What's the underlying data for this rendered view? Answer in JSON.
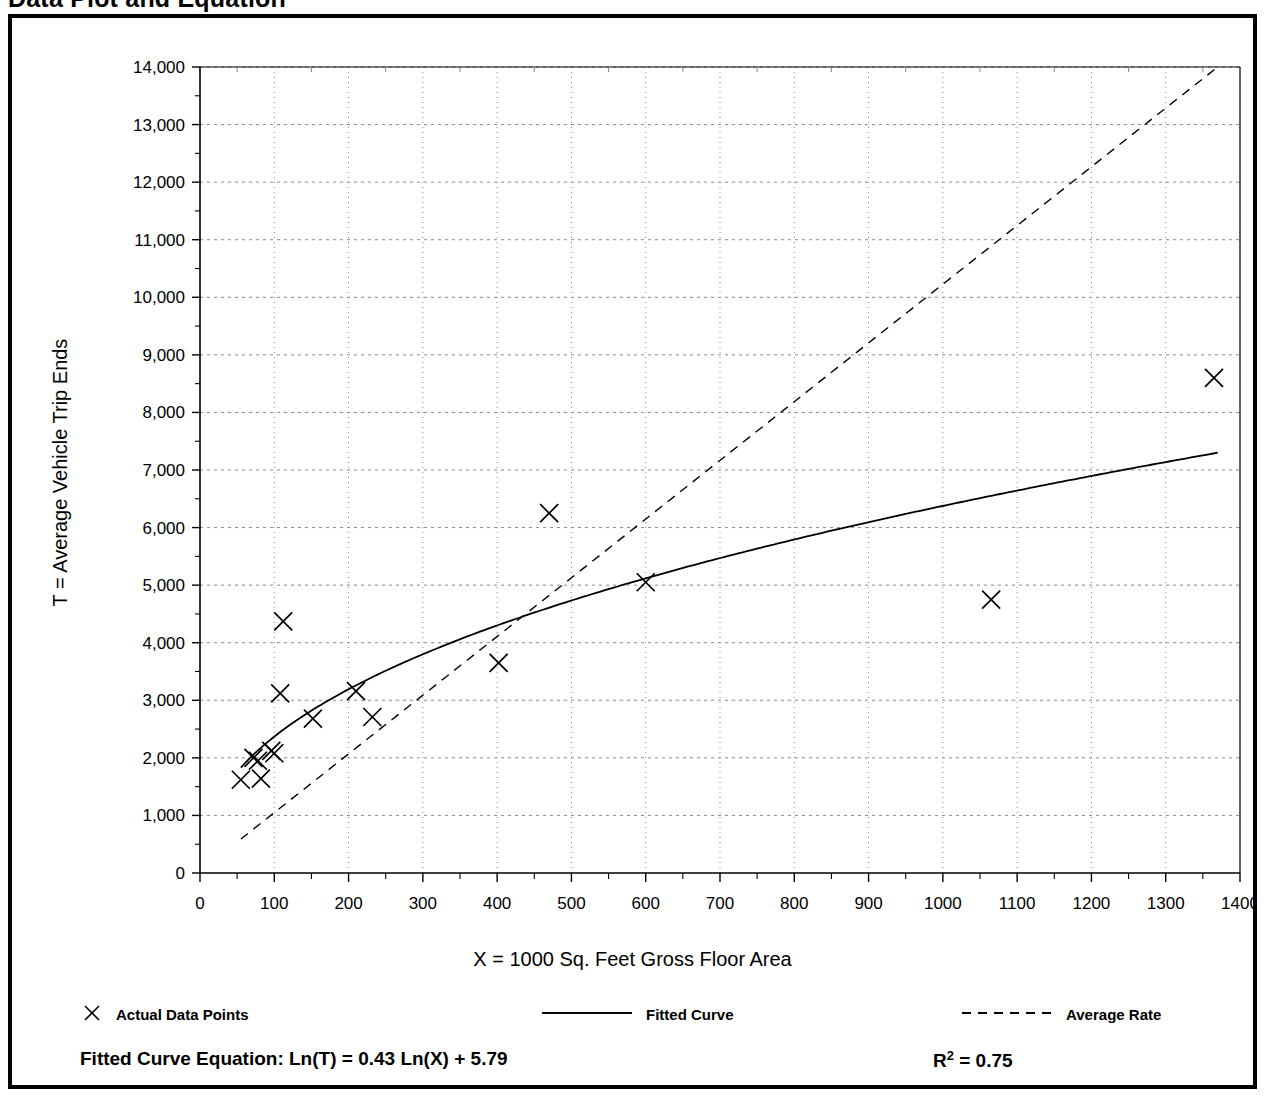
{
  "document": {
    "title": "Data Plot and Equation"
  },
  "chart_data": {
    "type": "scatter",
    "title": "Data Plot and Equation",
    "xlabel": "X = 1000 Sq. Feet Gross Floor Area",
    "ylabel": "T = Average Vehicle Trip Ends",
    "xlim": [
      0,
      1400
    ],
    "ylim": [
      0,
      14000
    ],
    "xticks": [
      0,
      100,
      200,
      300,
      400,
      500,
      600,
      700,
      800,
      900,
      1000,
      1100,
      1200,
      1300,
      1400
    ],
    "xtick_labels": [
      "0",
      "100",
      "200",
      "300",
      "400",
      "500",
      "600",
      "700",
      "800",
      "900",
      "1000",
      "1100",
      "1200",
      "1300",
      "1400"
    ],
    "yticks": [
      0,
      1000,
      2000,
      3000,
      4000,
      5000,
      6000,
      7000,
      8000,
      9000,
      10000,
      11000,
      12000,
      13000,
      14000
    ],
    "ytick_labels": [
      "0",
      "1,000",
      "2,000",
      "3,000",
      "4,000",
      "5,000",
      "6,000",
      "7,000",
      "8,000",
      "9,000",
      "10,000",
      "11,000",
      "12,000",
      "13,000",
      "14,000"
    ],
    "x_minor_interval": 50,
    "y_minor_interval": 500,
    "grid": true,
    "grid_style": "dotted",
    "legend_position": "below-axes",
    "series": [
      {
        "name": "Actual Data Points",
        "type": "scatter",
        "marker": "x",
        "points": [
          [
            55,
            1620
          ],
          [
            72,
            2000
          ],
          [
            78,
            1950
          ],
          [
            82,
            1640
          ],
          [
            96,
            2120
          ],
          [
            100,
            2080
          ],
          [
            112,
            4370
          ],
          [
            108,
            3120
          ],
          [
            152,
            2680
          ],
          [
            210,
            3160
          ],
          [
            232,
            2710
          ],
          [
            402,
            3650
          ],
          [
            470,
            6250
          ],
          [
            600,
            5050
          ],
          [
            1065,
            4750
          ],
          [
            1365,
            8600
          ]
        ]
      },
      {
        "name": "Fitted Curve",
        "type": "line",
        "style": "solid",
        "equation": "Ln(T) = 0.43 Ln(X) + 5.79",
        "coef_a": 0.43,
        "coef_b": 5.79,
        "x_range": [
          55,
          1370
        ]
      },
      {
        "name": "Average Rate",
        "type": "line",
        "style": "dashed",
        "x_range": [
          55,
          1370
        ],
        "points": [
          [
            55,
            590
          ],
          [
            1370,
            14000
          ]
        ]
      }
    ]
  },
  "legend": {
    "items": [
      {
        "label": "Actual Data Points",
        "marker": "x-marker",
        "left_px": 70
      },
      {
        "label": "Fitted Curve",
        "marker": "solid-line",
        "left_px": 530
      },
      {
        "label": "Average Rate",
        "marker": "dashed-line",
        "left_px": 950
      }
    ]
  },
  "equation_row": {
    "fitted_curve_equation": "Fitted Curve Equation:  Ln(T) = 0.43 Ln(X) + 5.79",
    "r_squared_symbol": "R",
    "r_squared_exponent": "2",
    "r_squared_value": "= 0.75"
  },
  "colors": {
    "ink": "#000000",
    "grid": "#8a8a8a",
    "background": "#ffffff"
  }
}
